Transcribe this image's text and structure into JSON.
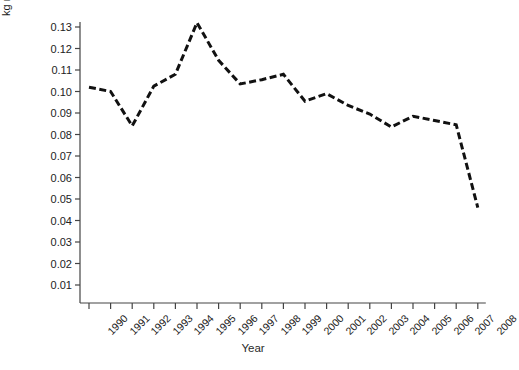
{
  "chart_data": {
    "type": "line",
    "title": "",
    "xlabel": "Year",
    "ylabel": "kg nutrients/€",
    "categories": [
      "1990",
      "1991",
      "1992",
      "1993",
      "1994",
      "1995",
      "1996",
      "1997",
      "1998",
      "1999",
      "2000",
      "2001",
      "2002",
      "2003",
      "2004",
      "2005",
      "2006",
      "2007",
      "2008"
    ],
    "values": [
      0.102,
      0.1,
      0.084,
      0.1025,
      0.108,
      0.132,
      0.1145,
      0.1035,
      0.1055,
      0.108,
      0.0955,
      0.099,
      0.0935,
      0.0895,
      0.0835,
      0.0885,
      0.0865,
      0.0845,
      0.046
    ],
    "ylim": [
      0.0,
      0.1375
    ],
    "ytick_labels": [
      "0.01",
      "0.02",
      "0.03",
      "0.04",
      "0.05",
      "0.06",
      "0.07",
      "0.08",
      "0.09",
      "0.10",
      "0.11",
      "0.12",
      "0.13"
    ],
    "ytick_values": [
      0.01,
      0.02,
      0.03,
      0.04,
      0.05,
      0.06,
      0.07,
      0.08,
      0.09,
      0.1,
      0.11,
      0.12,
      0.13
    ],
    "xtick_labels": [
      "1990",
      "1991",
      "1992",
      "1993",
      "1994",
      "1995",
      "1996",
      "1997",
      "1998",
      "1999",
      "2000",
      "2001",
      "2002",
      "2003",
      "2004",
      "2005",
      "2006",
      "2007",
      "2008"
    ],
    "grid": false,
    "legend": false,
    "line_style": "dashed",
    "line_color": "#111111",
    "line_width": 3,
    "background_color": "#ffffff",
    "axis_color": "#444444",
    "xtick_rotation": -45
  }
}
